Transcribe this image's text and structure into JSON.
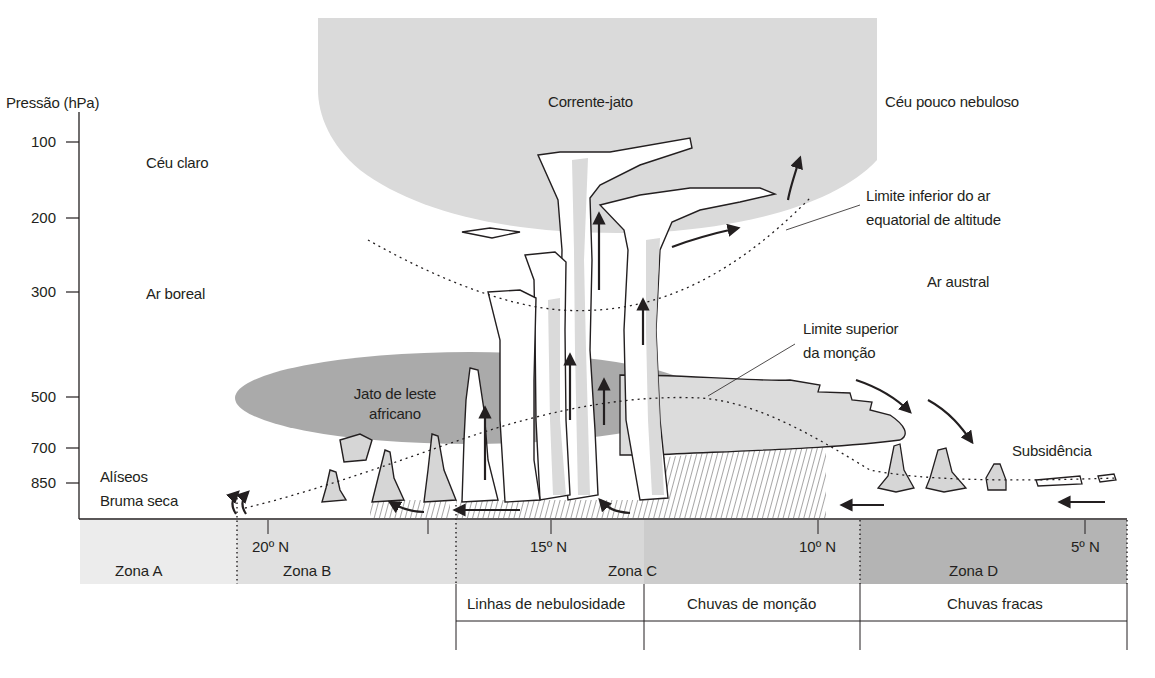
{
  "diagram": {
    "y_axis": {
      "label": "Pressão (hPa)",
      "ticks": [
        {
          "value": "100",
          "y": 142
        },
        {
          "value": "200",
          "y": 218
        },
        {
          "value": "300",
          "y": 292
        },
        {
          "value": "500",
          "y": 397
        },
        {
          "value": "700",
          "y": 448
        },
        {
          "value": "850",
          "y": 483
        }
      ]
    },
    "regions": {
      "clear_sky": "Céu claro",
      "boreal_air": "Ar boreal",
      "jet_stream": "Corrente-jato",
      "few_clouds": "Céu pouco nebuloso",
      "austral_air": "Ar austral",
      "african_easterly_jet_line1": "Jato de leste",
      "african_easterly_jet_line2": "africano",
      "trade_winds": "Alíseos",
      "dry_haze": "Bruma seca",
      "subsidence": "Subsidência"
    },
    "annotations": {
      "lower_limit_line1": "Limite inferior do ar",
      "lower_limit_line2": "equatorial de altitude",
      "upper_limit_line1": "Limite superior",
      "upper_limit_line2": "da monção"
    },
    "latitudes": [
      {
        "label": "20º N",
        "x": 268
      },
      {
        "label": "15º N",
        "x": 551
      },
      {
        "label": "10º N",
        "x": 818
      },
      {
        "label": "5º N",
        "x": 1085
      }
    ],
    "zones": [
      {
        "label": "Zona A",
        "x0": 80,
        "x1": 237,
        "color": "#ececec"
      },
      {
        "label": "Zona B",
        "x0": 237,
        "x1": 456,
        "color": "#e0e0e0"
      },
      {
        "label": "Zona C",
        "x0": 456,
        "x1": 860,
        "color": "#d2d2d2"
      },
      {
        "label": "Zona D",
        "x0": 860,
        "x1": 1127,
        "color": "#b4b4b4"
      }
    ],
    "rain_bands": [
      {
        "label": "Linhas de nebulosidade",
        "x0": 456,
        "x1": 644
      },
      {
        "label": "Chuvas de monção",
        "x0": 644,
        "x1": 860
      },
      {
        "label": "Chuvas fracas",
        "x0": 860,
        "x1": 1127
      }
    ],
    "colors": {
      "jet_fill": "#d9d9d9",
      "aej_fill": "#a9a9a9",
      "cloud_fill": "#d6d6d6",
      "outline": "#231f20",
      "background": "#ffffff"
    }
  }
}
